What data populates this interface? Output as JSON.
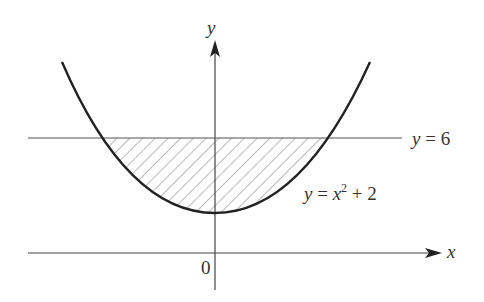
{
  "diagram": {
    "axes": {
      "x_label": "x",
      "y_label": "y",
      "origin_label": "0"
    },
    "curve": {
      "label_lhs": "y",
      "label_eq": " = ",
      "label_var": "x",
      "label_exp": "2",
      "label_rest": " + 2",
      "equation": "y = x^2 + 2"
    },
    "line": {
      "label_lhs": "y",
      "label_rest": " = 6",
      "equation": "y = 6"
    },
    "shaded_region": "Region between y = x^2 + 2 and y = 6 (hatched)"
  }
}
